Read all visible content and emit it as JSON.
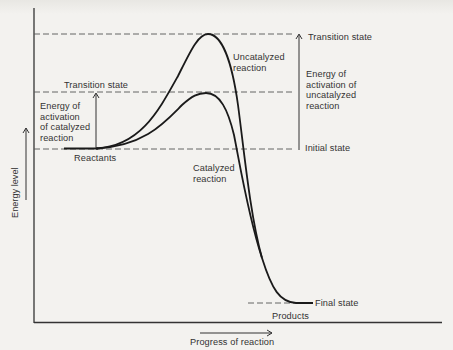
{
  "diagram": {
    "type": "energy-profile",
    "title": "",
    "axes": {
      "y_label": "Energy level",
      "x_label": "Progress of reaction"
    },
    "levels": {
      "uncatalyzed_transition": "Transition state",
      "catalyzed_transition": "Transition state",
      "initial": "Initial state",
      "final": "Final state"
    },
    "labels": {
      "reactants": "Reactants",
      "products": "Products",
      "uncatalyzed_curve": "Uncatalyzed\nreaction",
      "catalyzed_curve": "Catalyzed\nreaction",
      "ea_catalyzed": "Energy of\nactivation\nof catalyzed\nreaction",
      "ea_uncatalyzed": "Energy of\nactivation of\nuncatalyzed\nreaction"
    },
    "colors": {
      "line": "#1a1a1a",
      "background": "#f3f2ef",
      "dashed": "#555555"
    },
    "relative_energies": {
      "reactants": 0,
      "catalyzed_transition_state": 1,
      "uncatalyzed_transition_state": 2.04,
      "products": -2.8
    }
  }
}
